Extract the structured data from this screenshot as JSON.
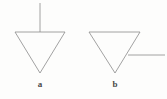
{
  "figure": {
    "background_color": "#fdfdfc",
    "stroke_color": "#8a8a8a",
    "label_color": "#4a4a4a",
    "stroke_width": 0.8,
    "panels": [
      {
        "id": "panel-a",
        "label": "a",
        "label_position": {
          "x": 40,
          "y": 84
        },
        "symbol": "downward-triangle",
        "triangle": {
          "top_left": {
            "x": 15,
            "y": 32
          },
          "top_right": {
            "x": 65,
            "y": 32
          },
          "bottom_apex": {
            "x": 40,
            "y": 73
          }
        },
        "lead_line": {
          "orientation": "vertical",
          "from": {
            "x": 40,
            "y": 3
          },
          "to": {
            "x": 40,
            "y": 32
          },
          "attach_edge": "top-edge-midpoint"
        }
      },
      {
        "id": "panel-b",
        "label": "b",
        "label_position": {
          "x": 115,
          "y": 84
        },
        "symbol": "downward-triangle",
        "triangle": {
          "top_left": {
            "x": 89,
            "y": 32
          },
          "top_right": {
            "x": 140,
            "y": 32
          },
          "bottom_apex": {
            "x": 115,
            "y": 73
          }
        },
        "lead_line": {
          "orientation": "horizontal",
          "from": {
            "x": 128,
            "y": 55
          },
          "to": {
            "x": 165,
            "y": 55
          },
          "attach_edge": "right-edge-midpoint"
        }
      }
    ]
  }
}
